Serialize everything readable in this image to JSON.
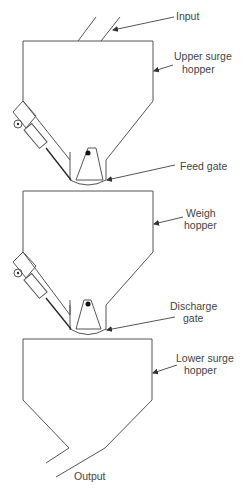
{
  "diagram": {
    "labels": {
      "input": "Input",
      "upper_surge_1": "Upper surge",
      "upper_surge_2": "hopper",
      "feed_gate": "Feed gate",
      "weigh_1": "Weigh",
      "weigh_2": "hopper",
      "discharge_1": "Discharge",
      "discharge_2": "gate",
      "lower_surge_1": "Lower surge",
      "lower_surge_2": "hopper",
      "output": "Output"
    },
    "colors": {
      "line": "#555555",
      "text": "#444444",
      "background": "#ffffff"
    }
  }
}
